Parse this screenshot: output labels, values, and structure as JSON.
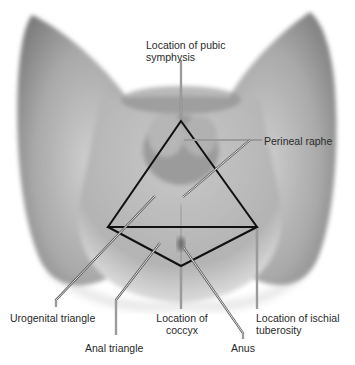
{
  "figure": {
    "colors": {
      "background": "#ffffff",
      "skin_light": "#d9d9d9",
      "skin_mid": "#a8a8a8",
      "skin_dark": "#6e6e6e",
      "outline": "#111111",
      "leader_light": "#f2f2f2",
      "leader_dark": "#555555",
      "label_text": "#2a2a2a"
    },
    "diamond": {
      "top": [
        181,
        121
      ],
      "left": [
        108,
        227
      ],
      "right": [
        257,
        227
      ],
      "bottom": [
        181,
        266
      ],
      "divider": "horizontal line from left to right vertex"
    },
    "labels": {
      "pubic_symphysis": "Location of pubic\nsymphysis",
      "perineal_raphe": "Perineal raphe",
      "urogenital_triangle": "Urogenital triangle",
      "anal_triangle": "Anal triangle",
      "coccyx": "Location of\ncoccyx",
      "ischial_tuberosity": "Location of ischial\ntuberosity",
      "anus": "Anus"
    }
  }
}
